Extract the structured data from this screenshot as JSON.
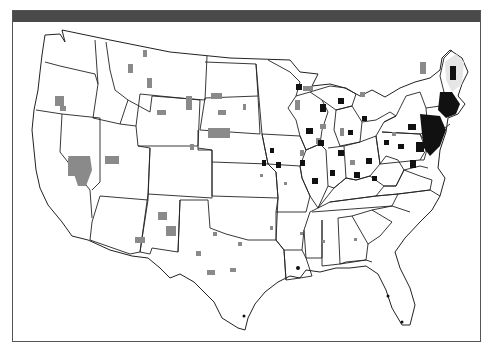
{
  "map": {
    "subject": "United States county map",
    "projection": "Albers-like conterminous US",
    "legend": null,
    "colors": {
      "frame_border": "#555555",
      "header_bar": "#4a4a4a",
      "state_outline": "#222222",
      "category_low": "#8a8a8a",
      "category_high": "#111111",
      "category_light": "#e6e6e6",
      "background": "#ffffff"
    },
    "shading_categories": [
      {
        "name": "gray-counties",
        "color": "#8a8a8a"
      },
      {
        "name": "black-counties",
        "color": "#111111"
      }
    ],
    "dense_regions": [
      "Northeast corridor",
      "Ohio Valley",
      "Upper Midwest",
      "New England"
    ]
  }
}
